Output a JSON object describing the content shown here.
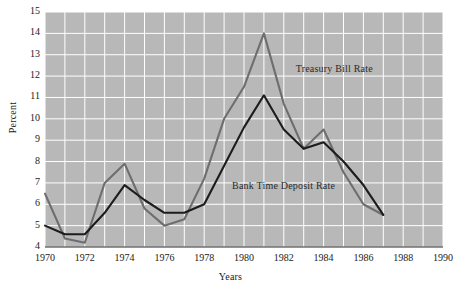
{
  "chart_data": {
    "type": "line",
    "title": "",
    "xlabel": "Years",
    "ylabel": "Percent",
    "xlim": [
      1970,
      1990
    ],
    "ylim": [
      4,
      15
    ],
    "grid": true,
    "grid_color": "#ffffff",
    "plot_background": "#b8b8b8",
    "legend_position": "inline-annotation",
    "x_tick_labels": [
      "1970",
      "1972",
      "1974",
      "1976",
      "1978",
      "1980",
      "1982",
      "1984",
      "1986",
      "1988",
      "1990"
    ],
    "y_tick_labels": [
      "4",
      "5",
      "6",
      "7",
      "8",
      "9",
      "10",
      "11",
      "12",
      "13",
      "14",
      "15"
    ],
    "x": [
      1970,
      1971,
      1972,
      1973,
      1974,
      1975,
      1976,
      1977,
      1978,
      1979,
      1980,
      1981,
      1982,
      1983,
      1984,
      1985,
      1986,
      1987
    ],
    "series": [
      {
        "name": "Treasury Bill Rate",
        "color": "#6e6e6e",
        "values": [
          6.5,
          4.4,
          4.2,
          7.0,
          7.9,
          5.8,
          5.0,
          5.3,
          7.2,
          10.0,
          11.5,
          14.0,
          10.7,
          8.6,
          9.5,
          7.5,
          6.0,
          5.5
        ]
      },
      {
        "name": "Bank Time Deposit Rate",
        "color": "#1c1c1c",
        "values": [
          5.0,
          4.6,
          4.6,
          5.6,
          6.9,
          6.2,
          5.6,
          5.6,
          6.0,
          7.8,
          9.6,
          11.1,
          9.5,
          8.6,
          8.9,
          8.0,
          6.9,
          5.5
        ]
      }
    ],
    "annotations": [
      {
        "text": "Treasury Bill Rate",
        "x": 1982.6,
        "y": 12.3
      },
      {
        "text": "Bank Time Deposit Rate",
        "x": 1979.4,
        "y": 6.8
      }
    ]
  }
}
